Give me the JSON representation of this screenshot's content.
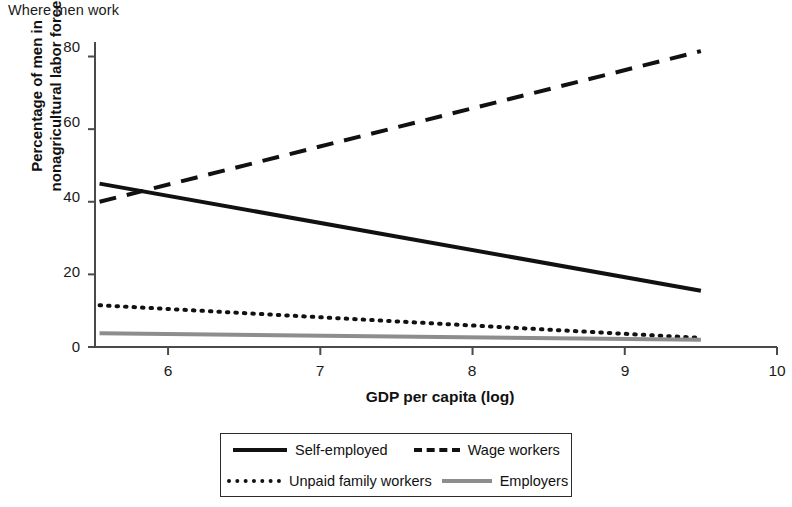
{
  "title": "Where men work",
  "chart_data": {
    "type": "line",
    "title": "Where men work",
    "xlabel": "GDP per capita (log)",
    "ylabel": "Percentage of men in nonagricultural labor force",
    "ylabel_lines": [
      "Percentage of men in",
      "nonagricultural labor force"
    ],
    "xlim": [
      5.52,
      10.0
    ],
    "ylim": [
      0,
      84
    ],
    "xticks": [
      6,
      7,
      8,
      9,
      10
    ],
    "yticks": [
      0,
      20,
      40,
      60,
      80
    ],
    "xticklabels": [
      "6",
      "7",
      "8",
      "9",
      "10"
    ],
    "yticklabels": [
      "0",
      "20",
      "40",
      "60",
      "80"
    ],
    "grid": false,
    "legend_position": "below-center",
    "x_range_data": [
      5.55,
      9.5
    ],
    "series": [
      {
        "name": "Self-employed",
        "style": "solid",
        "color": "#111111",
        "width": 4,
        "x": [
          5.55,
          9.5
        ],
        "values": [
          45,
          15.5
        ]
      },
      {
        "name": "Wage workers",
        "style": "dashed",
        "color": "#111111",
        "width": 4,
        "x": [
          5.55,
          9.5
        ],
        "values": [
          40,
          81.5
        ]
      },
      {
        "name": "Unpaid family workers",
        "style": "dotted",
        "color": "#111111",
        "width": 4,
        "x": [
          5.55,
          9.5
        ],
        "values": [
          11.5,
          2.5
        ]
      },
      {
        "name": "Employers",
        "style": "solid",
        "color": "#8d8d8d",
        "width": 4,
        "x": [
          5.55,
          9.5
        ],
        "values": [
          3.8,
          2.0
        ]
      }
    ]
  },
  "axes": {
    "y_ticks": [
      {
        "label": "80",
        "top": 40
      },
      {
        "label": "60",
        "top": 115
      },
      {
        "label": "40",
        "top": 190
      },
      {
        "label": "20",
        "top": 265
      },
      {
        "label": "0",
        "top": 340
      }
    ],
    "x_ticks": [
      {
        "label": "6",
        "left": 168
      },
      {
        "label": "7",
        "left": 320
      },
      {
        "label": "8",
        "left": 472
      },
      {
        "label": "9",
        "left": 625
      },
      {
        "label": "10",
        "left": 777
      }
    ]
  },
  "legend": {
    "items": [
      {
        "label": "Self-employed",
        "style": "solid"
      },
      {
        "label": "Wage workers",
        "style": "dashed"
      },
      {
        "label": "Unpaid family workers",
        "style": "dotted"
      },
      {
        "label": "Employers",
        "style": "gray"
      }
    ]
  }
}
